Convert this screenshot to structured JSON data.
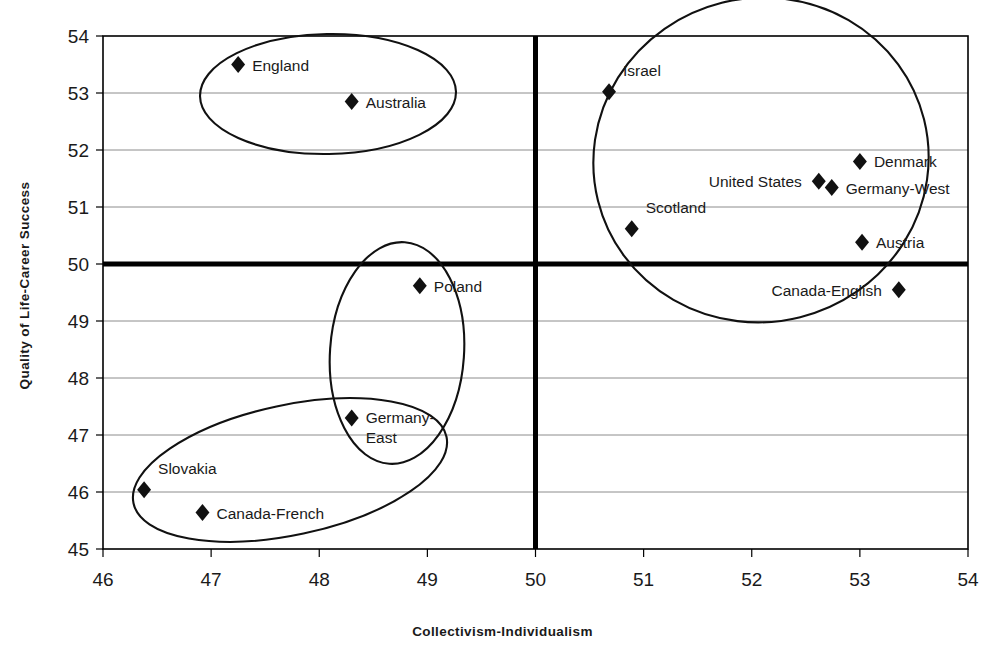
{
  "chart_data": {
    "type": "scatter",
    "title": "",
    "xlabel": "Collectivism-Individualism",
    "ylabel": "Quality of Life-Career Success",
    "xlim": [
      46,
      54
    ],
    "ylim": [
      45,
      54
    ],
    "xticks": [
      "46",
      "47",
      "48",
      "49",
      "50",
      "51",
      "52",
      "53",
      "54"
    ],
    "yticks": [
      "45",
      "46",
      "47",
      "48",
      "49",
      "50",
      "51",
      "52",
      "53",
      "54"
    ],
    "grid": "horizontal",
    "legend": "none",
    "reference_lines": [
      {
        "name": "vertical-midline",
        "axis": "x",
        "value": 50
      },
      {
        "name": "horizontal-midline",
        "axis": "y",
        "value": 50
      }
    ],
    "points": [
      {
        "label": "England",
        "x": 47.25,
        "y": 53.5,
        "label_pos": "right"
      },
      {
        "label": "Australia",
        "x": 48.3,
        "y": 52.85,
        "label_pos": "right"
      },
      {
        "label": "Israel",
        "x": 50.68,
        "y": 53.02,
        "label_pos": "above-right"
      },
      {
        "label": "Denmark",
        "x": 53.0,
        "y": 51.8,
        "label_pos": "right"
      },
      {
        "label": "United States",
        "x": 52.62,
        "y": 51.45,
        "label_pos": "left"
      },
      {
        "label": "Germany-West",
        "x": 52.74,
        "y": 51.34,
        "label_pos": "right"
      },
      {
        "label": "Scotland",
        "x": 50.89,
        "y": 50.62,
        "label_pos": "above-right"
      },
      {
        "label": "Austria",
        "x": 53.02,
        "y": 50.38,
        "label_pos": "right"
      },
      {
        "label": "Canada-English",
        "x": 53.36,
        "y": 49.55,
        "label_pos": "left"
      },
      {
        "label": "Poland",
        "x": 48.93,
        "y": 49.62,
        "label_pos": "right"
      },
      {
        "label": "Germany-East",
        "x": 48.3,
        "y": 47.3,
        "label_pos": "right"
      },
      {
        "label": "Slovakia",
        "x": 46.38,
        "y": 46.04,
        "label_pos": "above-right"
      },
      {
        "label": "Canada-French",
        "x": 46.92,
        "y": 45.64,
        "label_pos": "right"
      }
    ],
    "clusters": [
      {
        "name": "anglo-cluster",
        "members": [
          "England",
          "Australia"
        ]
      },
      {
        "name": "individualist-cluster",
        "members": [
          "Israel",
          "Denmark",
          "United States",
          "Germany-West",
          "Scotland",
          "Austria",
          "Canada-English"
        ]
      },
      {
        "name": "collectivist-cluster",
        "members": [
          "Slovakia",
          "Canada-French",
          "Germany-East"
        ]
      },
      {
        "name": "transition-cluster",
        "members": [
          "Poland",
          "Germany-East"
        ]
      }
    ]
  },
  "colors": {
    "marker": "#111111",
    "axis": "#000000",
    "grid": "#808080",
    "reference_line": "#000000",
    "ellipse": "#111111",
    "background": "#ffffff"
  }
}
